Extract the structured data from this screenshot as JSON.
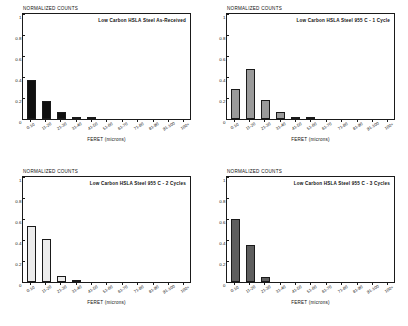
{
  "figure": {
    "panel_count": 4,
    "material": "Low Carbon HSLA Steel"
  },
  "axes": {
    "ylabel": "NORMALIZED COUNTS",
    "xlabel": "FERET (microns)",
    "ytick_labels": [
      "1",
      "0.8",
      "0.6",
      "0.4",
      "0.2",
      "0"
    ],
    "xtick_labels": [
      "0-10",
      "11-20",
      "21-30",
      "31-40",
      "41-50",
      "51-60",
      "61-70",
      "71-80",
      "81-90",
      "91-100",
      "100+"
    ]
  },
  "colors": {
    "axis": "#1a1a1a",
    "background": "#ffffff",
    "bar_as_received": "#101010",
    "bar_1_cycle": "#9a9a9a",
    "bar_2_cycles": "#ececec",
    "bar_3_cycles": "#5e5e5e"
  },
  "chart_data": [
    {
      "type": "bar",
      "title": "Low Carbon HSLA Steel   As-Received",
      "xlabel": "FERET (microns)",
      "ylabel": "NORMALIZED COUNTS",
      "ylim": [
        0,
        1
      ],
      "yticks": [
        0,
        0.2,
        0.4,
        0.6,
        0.8,
        1
      ],
      "grid": false,
      "legend": "none",
      "bar_color": "#101010",
      "categories": [
        "0-10",
        "11-20",
        "21-30",
        "31-40",
        "41-50",
        "51-60",
        "61-70",
        "71-80",
        "81-90",
        "91-100",
        "100+"
      ],
      "values": [
        0.375,
        0.175,
        0.065,
        0.018,
        0.015,
        0,
        0,
        0,
        0,
        0,
        0
      ]
    },
    {
      "type": "bar",
      "title": "Low Carbon HSLA Steel   955 C - 1 Cycle",
      "xlabel": "FERET (microns)",
      "ylabel": "NORMALIZED COUNTS",
      "ylim": [
        0,
        1
      ],
      "yticks": [
        0,
        0.2,
        0.4,
        0.6,
        0.8,
        1
      ],
      "grid": false,
      "legend": "none",
      "bar_color": "#9a9a9a",
      "categories": [
        "0-10",
        "11-20",
        "21-30",
        "31-40",
        "41-50",
        "51-60",
        "61-70",
        "71-80",
        "81-90",
        "91-100",
        "100+"
      ],
      "values": [
        0.29,
        0.48,
        0.18,
        0.065,
        0.008,
        0.006,
        0,
        0,
        0,
        0,
        0
      ]
    },
    {
      "type": "bar",
      "title": "Low Carbon HSLA Steel   955 C - 2 Cycles",
      "xlabel": "FERET (microns)",
      "ylabel": "NORMALIZED COUNTS",
      "ylim": [
        0,
        1
      ],
      "yticks": [
        0,
        0.2,
        0.4,
        0.6,
        0.8,
        1
      ],
      "grid": false,
      "legend": "none",
      "bar_color": "#ececec",
      "categories": [
        "0-10",
        "11-20",
        "21-30",
        "31-40",
        "41-50",
        "51-60",
        "61-70",
        "71-80",
        "81-90",
        "91-100",
        "100+"
      ],
      "values": [
        0.53,
        0.41,
        0.06,
        0.01,
        0,
        0,
        0,
        0,
        0,
        0,
        0
      ]
    },
    {
      "type": "bar",
      "title": "Low Carbon HSLA Steel   955 C - 3 Cycles",
      "xlabel": "FERET (microns)",
      "ylabel": "NORMALIZED COUNTS",
      "ylim": [
        0,
        1
      ],
      "yticks": [
        0,
        0.2,
        0.4,
        0.6,
        0.8,
        1
      ],
      "grid": false,
      "legend": "none",
      "bar_color": "#5e5e5e",
      "categories": [
        "0-10",
        "11-20",
        "21-30",
        "31-40",
        "41-50",
        "51-60",
        "61-70",
        "71-80",
        "81-90",
        "91-100",
        "100+"
      ],
      "values": [
        0.6,
        0.35,
        0.05,
        0,
        0,
        0,
        0,
        0,
        0,
        0,
        0
      ]
    }
  ]
}
